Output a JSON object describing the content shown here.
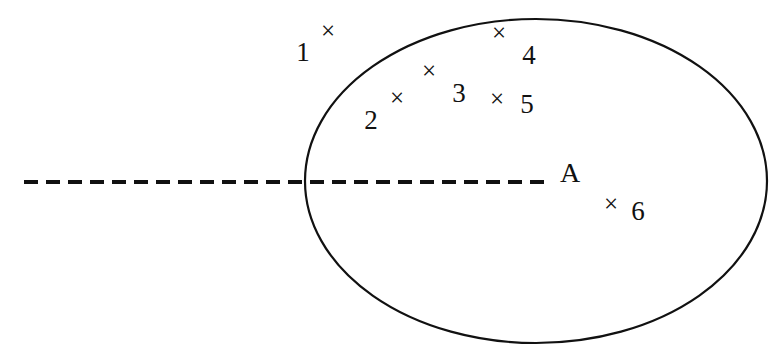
{
  "figure": {
    "type": "venn-like-region-diagram",
    "background_color": "#ffffff",
    "stroke_color": "#111111",
    "canvas": {
      "width": 781,
      "height": 362
    }
  },
  "region": {
    "name": "ellipse-region",
    "label": "A",
    "label_position": {
      "x": 570,
      "y": 172
    },
    "shape": "ellipse",
    "center": {
      "x": 536,
      "y": 181
    },
    "radius_x": 231,
    "radius_y": 162,
    "stroke_width": 2.2,
    "fill": "none"
  },
  "boundary_line": {
    "name": "dashed-axis-line",
    "style": "dashed",
    "x_start": 24,
    "x_end": 546,
    "y": 182,
    "stroke_width": 4,
    "dash": "14 8"
  },
  "points": [
    {
      "id": "1",
      "glyph": "×",
      "marker": {
        "x": 328,
        "y": 30
      },
      "label": {
        "x": 303,
        "y": 52
      },
      "inside_region": false
    },
    {
      "id": "2",
      "glyph": "×",
      "marker": {
        "x": 397,
        "y": 97
      },
      "label": {
        "x": 371,
        "y": 120
      },
      "inside_region": true
    },
    {
      "id": "3",
      "glyph": "×",
      "marker": {
        "x": 429,
        "y": 70
      },
      "label": {
        "x": 459,
        "y": 93
      },
      "inside_region": true
    },
    {
      "id": "4",
      "glyph": "×",
      "marker": {
        "x": 499,
        "y": 32
      },
      "label": {
        "x": 529,
        "y": 55
      },
      "inside_region": true
    },
    {
      "id": "5",
      "glyph": "×",
      "marker": {
        "x": 497,
        "y": 98
      },
      "label": {
        "x": 527,
        "y": 104
      },
      "inside_region": true
    },
    {
      "id": "6",
      "glyph": "×",
      "marker": {
        "x": 611,
        "y": 203
      },
      "label": {
        "x": 638,
        "y": 211
      },
      "inside_region": true
    }
  ]
}
